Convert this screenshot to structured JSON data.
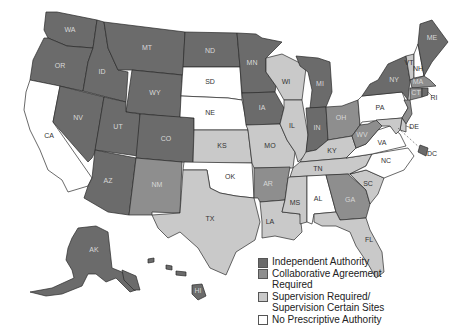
{
  "map": {
    "type": "choropleth",
    "region": "United States",
    "colors": {
      "independent": "#6b6b6b",
      "collaborative": "#8e8e8e",
      "supervision": "#c9c9c9",
      "none": "#ffffff"
    },
    "legend": [
      {
        "key": "independent",
        "label": "Independent Authority"
      },
      {
        "key": "collaborative",
        "label": "Collaborative Agreement\nRequired"
      },
      {
        "key": "supervision",
        "label": "Supervision Required/\nSupervision Certain Sites"
      },
      {
        "key": "none",
        "label": "No Prescriptive Authority"
      }
    ],
    "states": {
      "WA": {
        "label": "WA",
        "category": "independent"
      },
      "OR": {
        "label": "OR",
        "category": "independent"
      },
      "CA": {
        "label": "CA",
        "category": "none"
      },
      "ID": {
        "label": "ID",
        "category": "independent"
      },
      "NV": {
        "label": "NV",
        "category": "independent"
      },
      "MT": {
        "label": "MT",
        "category": "independent"
      },
      "WY": {
        "label": "WY",
        "category": "independent"
      },
      "UT": {
        "label": "UT",
        "category": "independent"
      },
      "CO": {
        "label": "CO",
        "category": "independent"
      },
      "AZ": {
        "label": "AZ",
        "category": "independent"
      },
      "NM": {
        "label": "NM",
        "category": "collaborative"
      },
      "ND": {
        "label": "ND",
        "category": "independent"
      },
      "SD": {
        "label": "SD",
        "category": "none"
      },
      "NE": {
        "label": "NE",
        "category": "none"
      },
      "KS": {
        "label": "KS",
        "category": "supervision"
      },
      "OK": {
        "label": "OK",
        "category": "none"
      },
      "TX": {
        "label": "TX",
        "category": "supervision"
      },
      "MN": {
        "label": "MN",
        "category": "independent"
      },
      "IA": {
        "label": "IA",
        "category": "independent"
      },
      "MO": {
        "label": "MO",
        "category": "supervision"
      },
      "AR": {
        "label": "AR",
        "category": "collaborative"
      },
      "LA": {
        "label": "LA",
        "category": "supervision"
      },
      "WI": {
        "label": "WI",
        "category": "supervision"
      },
      "IL": {
        "label": "IL",
        "category": "supervision"
      },
      "MI": {
        "label": "MI",
        "category": "independent"
      },
      "IN": {
        "label": "IN",
        "category": "independent"
      },
      "OH": {
        "label": "OH",
        "category": "collaborative"
      },
      "KY": {
        "label": "KY",
        "category": "supervision"
      },
      "TN": {
        "label": "TN",
        "category": "supervision"
      },
      "MS": {
        "label": "MS",
        "category": "supervision"
      },
      "AL": {
        "label": "AL",
        "category": "none"
      },
      "GA": {
        "label": "GA",
        "category": "collaborative"
      },
      "FL": {
        "label": "FL",
        "category": "supervision"
      },
      "SC": {
        "label": "SC",
        "category": "supervision"
      },
      "NC": {
        "label": "NC",
        "category": "none"
      },
      "VA": {
        "label": "VA",
        "category": "none"
      },
      "WV": {
        "label": "WV",
        "category": "collaborative"
      },
      "PA": {
        "label": "PA",
        "category": "none"
      },
      "NY": {
        "label": "NY",
        "category": "independent"
      },
      "VT": {
        "label": "VT",
        "category": "supervision"
      },
      "NH": {
        "label": "NH",
        "category": "none"
      },
      "ME": {
        "label": "ME",
        "category": "independent"
      },
      "MA": {
        "label": "MA",
        "category": "collaborative"
      },
      "CT": {
        "label": "CT",
        "category": "collaborative"
      },
      "RI": {
        "label": "RI",
        "category": "independent"
      },
      "NJ": {
        "label": "NJ",
        "category": "collaborative"
      },
      "DE": {
        "label": "DE",
        "category": "supervision"
      },
      "MD": {
        "label": "MD",
        "category": "supervision"
      },
      "DC": {
        "label": "DC",
        "category": "independent"
      },
      "AK": {
        "label": "AK",
        "category": "independent"
      },
      "HI": {
        "label": "HI",
        "category": "independent"
      }
    }
  }
}
